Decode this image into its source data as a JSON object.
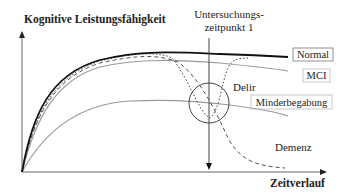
{
  "diagram": {
    "y_axis_label": "Kognitive Leistungsfähigkeit",
    "x_axis_label": "Zeitverlauf",
    "time_point": {
      "line1": "Untersuchungs-",
      "line2": "zeitpunkt 1"
    },
    "curves": [
      {
        "name": "Normal",
        "style": "solid-black",
        "boxed": true
      },
      {
        "name": "MCI",
        "style": "solid-gray",
        "boxed": true
      },
      {
        "name": "Minderbegabung",
        "style": "solid-gray",
        "boxed": true
      },
      {
        "name": "Delir",
        "style": "dotted",
        "boxed": false
      },
      {
        "name": "Demenz",
        "style": "dashed",
        "boxed": false
      }
    ],
    "colors": {
      "normal": "#111111",
      "gray_curve": "#9a9a9a",
      "axis": "#555555"
    }
  }
}
